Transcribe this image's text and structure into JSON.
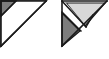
{
  "canvas": {
    "width": 109,
    "height": 59,
    "background": "#ffffff"
  },
  "palette": {
    "outline": "#1a1a1a",
    "dark_gray": "#7d7d7d",
    "light_gray": "#d8d8d8",
    "white": "#ffffff"
  },
  "figures": [
    {
      "id": "left-triangle-figure",
      "name": "right-triangle-with-dark-corner",
      "outer_triangle": {
        "name": "outer-right-triangle",
        "points": "1,1 46,1 1,46",
        "fill": "#ffffff",
        "stroke": "#1a1a1a",
        "stroke_width": 1.6
      },
      "regions": [
        {
          "name": "dark-corner-triangle",
          "points": "1,1 16,1 1,16",
          "fill": "#7d7d7d",
          "stroke": "#1a1a1a",
          "stroke_width": 1.4
        },
        {
          "name": "white-main-region",
          "points": "16,1 46,1 1,46 1,16",
          "fill": "#ffffff",
          "stroke": "none",
          "stroke_width": 0
        }
      ],
      "divider_lines": [
        {
          "name": "corner-divider-line",
          "x1": 16,
          "y1": 1,
          "x2": 1,
          "y2": 16,
          "stroke": "#1a1a1a",
          "stroke_width": 1.4
        },
        {
          "name": "hypotenuse-line",
          "x1": 46,
          "y1": 1,
          "x2": 1,
          "y2": 46,
          "stroke": "#1a1a1a",
          "stroke_width": 1.6
        }
      ]
    },
    {
      "id": "right-triangle-figure",
      "name": "right-triangle-with-chevron-notch",
      "outer_triangle": {
        "name": "outer-right-triangle",
        "points": "62,1 107,1 62,46",
        "fill": "#ffffff",
        "stroke": "#1a1a1a",
        "stroke_width": 1.6
      },
      "regions": [
        {
          "name": "light-gray-top-triangle",
          "points": "66,3 105,3 85,26",
          "fill": "#d8d8d8",
          "stroke": "#1a1a1a",
          "stroke_width": 1.4
        },
        {
          "name": "white-chevron-notch",
          "points": "62,1 66,3 85,26 80,30 62,9",
          "fill": "#ffffff",
          "stroke": "none",
          "stroke_width": 0
        },
        {
          "name": "dark-gray-lower-triangle",
          "points": "62,13 80,31 62,46",
          "fill": "#7d7d7d",
          "stroke": "#1a1a1a",
          "stroke_width": 1.4
        },
        {
          "name": "white-lower-right-region",
          "points": "85,26 107,1 62,46 80,31",
          "fill": "#ffffff",
          "stroke": "none",
          "stroke_width": 0
        }
      ],
      "divider_lines": [
        {
          "name": "upper-notch-edge-line",
          "x1": 62,
          "y1": 1,
          "x2": 85,
          "y2": 26,
          "stroke": "#1a1a1a",
          "stroke_width": 1.4
        },
        {
          "name": "lower-notch-edge-line",
          "x1": 62,
          "y1": 12,
          "x2": 81,
          "y2": 31,
          "stroke": "#1a1a1a",
          "stroke_width": 1.4
        },
        {
          "name": "light-gray-base-line",
          "x1": 66,
          "y1": 3,
          "x2": 105,
          "y2": 3,
          "stroke": "#1a1a1a",
          "stroke_width": 1.0
        },
        {
          "name": "notch-to-hypotenuse-line",
          "x1": 85,
          "y1": 26,
          "x2": 92,
          "y2": 16,
          "stroke": "#1a1a1a",
          "stroke_width": 1.2
        },
        {
          "name": "hypotenuse-line",
          "x1": 107,
          "y1": 1,
          "x2": 62,
          "y2": 46,
          "stroke": "#1a1a1a",
          "stroke_width": 1.6
        }
      ]
    }
  ]
}
